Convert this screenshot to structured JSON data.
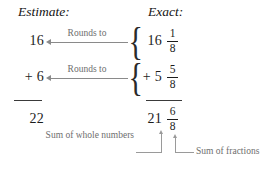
{
  "headings": {
    "estimate": "Estimate:",
    "exact": "Exact:"
  },
  "estimate_column": {
    "term1": "16",
    "term2": "+ 6",
    "sum": "22"
  },
  "exact_column": {
    "term1_whole": "16",
    "term1_numerator": "1",
    "term1_denominator": "8",
    "term2_whole": "+ 5",
    "term2_numerator": "5",
    "term2_denominator": "8",
    "sum_whole": "21",
    "sum_numerator": "6",
    "sum_denominator": "8"
  },
  "arrows": {
    "rounds_to_1": "Rounds to",
    "rounds_to_2": "Rounds to"
  },
  "braces": {
    "brace_1": "{",
    "brace_2": "{"
  },
  "annotations": {
    "whole_numbers": "Sum of whole numbers",
    "fractions": "Sum of fractions"
  },
  "colors": {
    "text": "#1c1c1c",
    "annotation": "#6e6e6e",
    "arrow": "#8a8a8a",
    "leader": "#9a9a9a",
    "background": "#ffffff"
  }
}
